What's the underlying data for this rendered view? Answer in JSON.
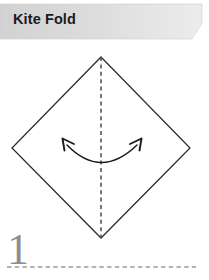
{
  "page": {
    "width": 209,
    "height": 280,
    "background_color": "#ffffff"
  },
  "header": {
    "title": "Kite Fold",
    "banner_fill_left": "#d4d4d4",
    "banner_fill_right": "#e8e8e8",
    "title_color": "#1b1b1b",
    "shape": "slanted-ribbon"
  },
  "diagram": {
    "name": "origami-kite-fold-step-diagram",
    "type": "origami-instruction",
    "paper_shape": "diamond",
    "paper_outline_color": "#2b2b2b",
    "paper_fill_color": "#ffffff",
    "vertices": {
      "top": [
        101,
        57
      ],
      "right": [
        190,
        148
      ],
      "bottom": [
        101,
        238
      ],
      "left": [
        12,
        148
      ]
    },
    "fold_line": {
      "name": "vertical-valley-fold-line",
      "style": "dashed",
      "color": "#4a4a4a",
      "from": [
        101,
        57
      ],
      "to": [
        101,
        238
      ],
      "orientation": "vertical"
    },
    "arrow": {
      "name": "double-headed-curved-fold-arrow",
      "style": "curved double-headed",
      "color": "#1b1b1b",
      "direction": "both",
      "left_head": [
        64,
        141
      ],
      "right_head": [
        140,
        141
      ],
      "arc_low_point": [
        101,
        166
      ]
    }
  },
  "step": {
    "number": "1",
    "number_color": "#8d8d8d"
  },
  "footer": {
    "rule_style": "dashed",
    "rule_color": "#9a9a9a"
  }
}
